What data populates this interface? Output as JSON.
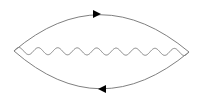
{
  "diagram": {
    "type": "feynman-diagram",
    "line_color": "#808080",
    "arrow_color": "#000000",
    "elements": {
      "top_propagator": {
        "kind": "fermion",
        "arrow_direction": "right"
      },
      "bottom_propagator": {
        "kind": "fermion",
        "arrow_direction": "left"
      },
      "internal_propagator": {
        "kind": "photon",
        "style": "wavy",
        "oscillations": 9
      }
    },
    "vertices": [
      "left-vertex",
      "right-vertex"
    ]
  }
}
